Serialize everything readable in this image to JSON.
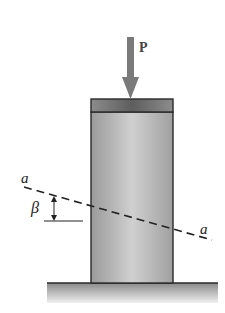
{
  "figure": {
    "type": "mechanics-diagram"
  },
  "labels": {
    "load": "P",
    "plane_left": "a",
    "plane_right": "a",
    "angle": "β"
  },
  "colors": {
    "background": "#ffffff",
    "column_dark": "#8a8a8a",
    "column_light": "#d2d2d2",
    "cap": "#6e6e6e",
    "arrow": "#7a7a7a",
    "outline": "#2a2a2a",
    "ground_top": "#7c7c7c",
    "ground_bottom": "#ebebeb"
  }
}
